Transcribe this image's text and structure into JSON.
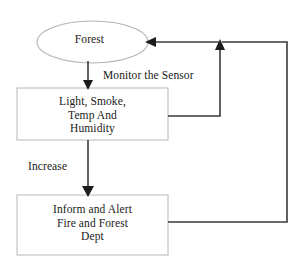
{
  "diagram": {
    "type": "flowchart",
    "colors": {
      "background": "#ffffff",
      "box_border": "#c8c8c8",
      "ellipse_border": "#b4b4b4",
      "connector": "#3a3a3a",
      "text": "#1a1a1a"
    },
    "nodes": [
      {
        "id": "forest",
        "shape": "ellipse",
        "label": "Forest"
      },
      {
        "id": "sensor",
        "shape": "rectangle",
        "label": "Light, Smoke,\nTemp And\nHumidity"
      },
      {
        "id": "alert",
        "shape": "rectangle",
        "label": "Inform and Alert\nFire and Forest\nDept"
      }
    ],
    "edges": [
      {
        "id": "forest-to-sensor",
        "from": "forest",
        "to": "sensor",
        "label": "",
        "arrow": "down"
      },
      {
        "id": "sensor-to-forest",
        "from": "sensor",
        "to": "forest",
        "label": "Monitor the Sensor",
        "arrow": "up-left"
      },
      {
        "id": "sensor-to-alert",
        "from": "sensor",
        "to": "alert",
        "label": "Increase",
        "arrow": "down"
      },
      {
        "id": "alert-to-forest",
        "from": "alert",
        "to": "forest",
        "label": "",
        "arrow": "left"
      }
    ]
  }
}
